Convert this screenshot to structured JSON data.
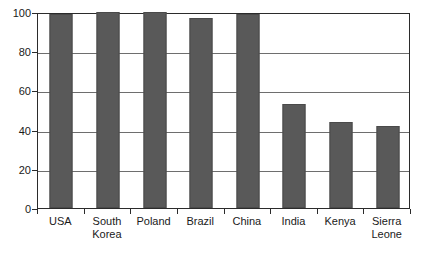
{
  "chart_data": {
    "type": "bar",
    "title": "",
    "subtitle": "",
    "xlabel": "",
    "ylabel": "",
    "categories": [
      "USA",
      "South Korea",
      "Poland",
      "Brazil",
      "China",
      "India",
      "Kenya",
      "Sierra Leone"
    ],
    "category_lines": [
      [
        "USA"
      ],
      [
        "South",
        "Korea"
      ],
      [
        "Poland"
      ],
      [
        "Brazil"
      ],
      [
        "China"
      ],
      [
        "India"
      ],
      [
        "Kenya"
      ],
      [
        "Sierra",
        "Leone"
      ]
    ],
    "values": [
      99,
      100,
      100,
      97,
      99,
      53,
      44,
      42
    ],
    "ylim": [
      0,
      100
    ],
    "yticks": [
      0,
      20,
      40,
      60,
      80,
      100
    ],
    "ytick_labels": [
      "0",
      "20",
      "40",
      "60",
      "80",
      "100"
    ],
    "grid": true,
    "grid_axis": "y",
    "legend": false,
    "legend_position": "none",
    "bar_color": "#595959",
    "bar_edge_color": "#4a4a4a",
    "axis_color": "#2b2b2b",
    "gridline_color": "#6e6e6e",
    "background_color": "#ffffff",
    "annotations": []
  },
  "axis": {
    "y_labels": [
      "100",
      "80",
      "60",
      "40",
      "20",
      "0"
    ]
  }
}
